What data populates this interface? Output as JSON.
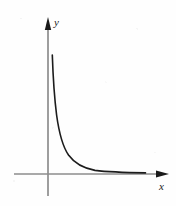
{
  "figure": {
    "title": "",
    "width": 176,
    "height": 206,
    "background_color": "#fefefe"
  },
  "axes": {
    "x_axis": {
      "label": "x",
      "label_x": 159,
      "label_y": 190,
      "color": "#8d8d8d",
      "line": {
        "x1": 14,
        "y1": 174,
        "x2": 158,
        "y2": 174
      },
      "arrow": {
        "name": "x-axis-arrowhead",
        "color": "#1a1a1a",
        "points": "156,170.5 169,174 156,177.5"
      }
    },
    "y_axis": {
      "label": "y",
      "label_x": 54,
      "label_y": 26,
      "color": "#8d8d8d",
      "line": {
        "x1": 48,
        "y1": 22,
        "x2": 48,
        "y2": 196
      },
      "arrow": {
        "name": "y-axis-arrowhead",
        "color": "#1a1a1a",
        "points": "44.8,30 48,17 51.2,30"
      }
    }
  },
  "chart_data": {
    "type": "line",
    "title": "",
    "xlabel": "x",
    "ylabel": "y",
    "grid": false,
    "legend": null,
    "axis_ranges": {
      "xlim": [
        0,
        10
      ],
      "ylim": [
        0,
        10
      ]
    },
    "annotations": [],
    "series": [
      {
        "name": "decay-curve",
        "description": "monotonically decreasing convex curve asymptotic to the x-axis",
        "color": "#1c1c1c",
        "line_width": 1.6,
        "x": [
          0.3,
          0.35,
          0.42,
          0.5,
          0.62,
          0.78,
          1.0,
          1.3,
          1.7,
          2.2,
          2.8,
          3.6,
          4.5,
          5.6,
          7.0,
          8.6,
          10.2
        ],
        "y": [
          9.35,
          8.1,
          6.7,
          5.45,
          4.3,
          3.35,
          2.55,
          1.95,
          1.48,
          1.12,
          0.88,
          0.68,
          0.52,
          0.4,
          0.3,
          0.22,
          0.17
        ],
        "pixel_path": "M 52.3,55 C 53.1,78 54.4,98 56.6,115 C 59.2,134 63.0,147 68.5,155 C 75.0,164 84.0,168.3 95.0,170.4 C 108.0,172.0 126.0,172.6 145.5,172.9"
      }
    ]
  }
}
